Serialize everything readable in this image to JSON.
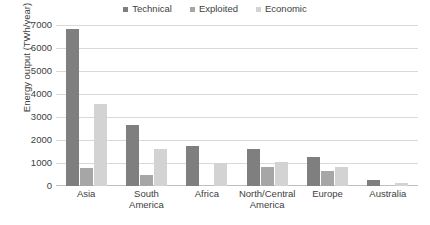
{
  "chart_data": {
    "type": "bar",
    "title": "",
    "subtitle": "",
    "xlabel": "",
    "ylabel": "Energy output (TWh/year)",
    "categories": [
      "Asia",
      "South America",
      "Africa",
      "North/Central America",
      "Europe",
      "Australia"
    ],
    "series": [
      {
        "name": "Technical",
        "color": "#7f7f7f",
        "values": [
          6820,
          2660,
          1760,
          1620,
          1250,
          280
        ]
      },
      {
        "name": "Exploited",
        "color": "#a6a6a6",
        "values": [
          780,
          490,
          0,
          820,
          660,
          0
        ]
      },
      {
        "name": "Economic",
        "color": "#d3d3d3",
        "values": [
          3560,
          1600,
          1020,
          1040,
          840,
          110
        ]
      }
    ],
    "ylim": [
      0,
      7000
    ],
    "y_ticks": [
      7000,
      6000,
      5000,
      4000,
      3000,
      2000,
      1000,
      0
    ],
    "y_tick_labels": [
      "7000",
      "6000",
      "5000",
      "4000",
      "3000",
      "2000",
      "1000",
      "0"
    ],
    "grid": true,
    "legend_position": "top-center",
    "background_color": "#ffffff",
    "gridline_color": "#d9d9d9",
    "text_color": "#404040"
  },
  "legend": {
    "entries": [
      {
        "label": "Technical"
      },
      {
        "label": "Exploited"
      },
      {
        "label": "Economic"
      }
    ]
  }
}
